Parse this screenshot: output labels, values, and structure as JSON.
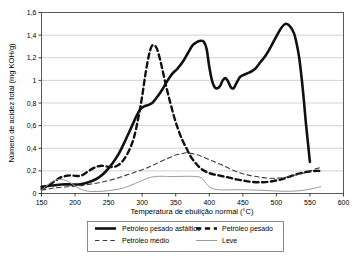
{
  "chart_data": {
    "type": "line",
    "title": "",
    "xlabel": "Temperatura de ebulição normal (°C)",
    "ylabel": "Número de acidez total (mg KOH/g)",
    "xlim": [
      150,
      600
    ],
    "ylim": [
      0,
      1.6
    ],
    "xticks": [
      150,
      200,
      250,
      300,
      350,
      400,
      450,
      500,
      550,
      600
    ],
    "yticks": [
      0,
      0.2,
      0.4,
      0.6,
      0.8,
      1,
      1.2,
      1.4,
      1.6
    ],
    "xtick_labels": [
      "150",
      "200",
      "250",
      "300",
      "350",
      "400",
      "450",
      "500",
      "550",
      "600"
    ],
    "ytick_labels": [
      "0",
      "0,2",
      "0,4",
      "0,6",
      "0,8",
      "1",
      "1,2",
      "1,4",
      "1,6"
    ],
    "grid": "horizontal",
    "legend_position": "bottom",
    "decimal_separator": ",",
    "series": [
      {
        "name": "Petróleo pesado asfáltico",
        "style": "solid-thick",
        "color": "#111111",
        "width": 2.6,
        "x": [
          150,
          165,
          180,
          195,
          205,
          215,
          225,
          235,
          245,
          255,
          265,
          275,
          285,
          292,
          298,
          303,
          308,
          315,
          322,
          330,
          338,
          345,
          352,
          360,
          368,
          375,
          382,
          388,
          392,
          396,
          400,
          404,
          408,
          412,
          416,
          420,
          424,
          428,
          432,
          436,
          440,
          446,
          452,
          460,
          468,
          476,
          484,
          492,
          500,
          508,
          514,
          520,
          526,
          530,
          534,
          538,
          541,
          544,
          547,
          549,
          550
        ],
        "y": [
          0.06,
          0.07,
          0.08,
          0.08,
          0.08,
          0.09,
          0.11,
          0.14,
          0.19,
          0.26,
          0.35,
          0.47,
          0.6,
          0.69,
          0.75,
          0.77,
          0.78,
          0.8,
          0.85,
          0.92,
          1.0,
          1.06,
          1.1,
          1.16,
          1.24,
          1.31,
          1.34,
          1.35,
          1.34,
          1.28,
          1.12,
          1.0,
          0.94,
          0.93,
          0.95,
          1.0,
          1.02,
          0.99,
          0.94,
          0.93,
          0.97,
          1.03,
          1.05,
          1.07,
          1.1,
          1.16,
          1.22,
          1.3,
          1.39,
          1.47,
          1.5,
          1.48,
          1.42,
          1.33,
          1.2,
          1.0,
          0.82,
          0.62,
          0.45,
          0.33,
          0.28
        ]
      },
      {
        "name": "Petróleo pesado",
        "style": "dashed-thick",
        "color": "#111111",
        "width": 2.4,
        "x": [
          150,
          160,
          170,
          178,
          186,
          194,
          202,
          210,
          218,
          226,
          234,
          240,
          246,
          252,
          258,
          264,
          270,
          276,
          282,
          288,
          294,
          300,
          305,
          310,
          314,
          318,
          322,
          326,
          330,
          336,
          342,
          348,
          354,
          360,
          366,
          372,
          378,
          384,
          390,
          398,
          406,
          414,
          422,
          430,
          440,
          450,
          460,
          470,
          480,
          490,
          500,
          510,
          520,
          530,
          540,
          550,
          560,
          566
        ],
        "y": [
          0.04,
          0.07,
          0.11,
          0.14,
          0.155,
          0.16,
          0.155,
          0.16,
          0.19,
          0.22,
          0.24,
          0.245,
          0.24,
          0.235,
          0.235,
          0.25,
          0.28,
          0.33,
          0.4,
          0.5,
          0.66,
          0.86,
          1.06,
          1.22,
          1.3,
          1.31,
          1.28,
          1.2,
          1.1,
          0.94,
          0.8,
          0.67,
          0.56,
          0.47,
          0.4,
          0.33,
          0.28,
          0.24,
          0.21,
          0.185,
          0.17,
          0.16,
          0.15,
          0.14,
          0.125,
          0.115,
          0.105,
          0.1,
          0.1,
          0.105,
          0.115,
          0.13,
          0.15,
          0.17,
          0.185,
          0.195,
          0.2,
          0.2
        ]
      },
      {
        "name": "Petróleo médio",
        "style": "dashed-thin",
        "color": "#3a3a3a",
        "width": 1.1,
        "x": [
          150,
          160,
          170,
          180,
          190,
          200,
          210,
          220,
          230,
          240,
          250,
          260,
          270,
          280,
          290,
          300,
          310,
          320,
          330,
          340,
          350,
          358,
          365,
          372,
          380,
          388,
          396,
          404,
          412,
          420,
          430,
          440,
          450,
          460,
          470,
          480,
          490,
          500,
          510,
          520,
          530,
          540,
          550,
          560,
          566
        ],
        "y": [
          0.03,
          0.04,
          0.05,
          0.055,
          0.06,
          0.065,
          0.07,
          0.08,
          0.09,
          0.1,
          0.115,
          0.13,
          0.15,
          0.17,
          0.19,
          0.21,
          0.235,
          0.26,
          0.29,
          0.315,
          0.34,
          0.35,
          0.36,
          0.355,
          0.345,
          0.33,
          0.31,
          0.29,
          0.27,
          0.25,
          0.22,
          0.195,
          0.175,
          0.16,
          0.15,
          0.14,
          0.135,
          0.135,
          0.14,
          0.15,
          0.165,
          0.18,
          0.2,
          0.22,
          0.23
        ]
      },
      {
        "name": "Leve",
        "style": "solid-thin",
        "color": "#9a9a9a",
        "width": 1.0,
        "x": [
          150,
          158,
          166,
          172,
          178,
          184,
          190,
          196,
          202,
          210,
          218,
          226,
          234,
          242,
          250,
          258,
          266,
          274,
          282,
          290,
          298,
          306,
          314,
          320,
          326,
          330,
          334,
          336,
          338,
          342,
          348,
          356,
          364,
          372,
          380,
          386,
          390,
          394,
          398,
          404,
          412,
          420,
          430,
          440,
          450,
          460,
          470,
          480,
          490,
          500,
          510,
          520,
          530,
          540,
          550,
          560,
          566
        ],
        "y": [
          0.03,
          0.07,
          0.105,
          0.12,
          0.125,
          0.12,
          0.105,
          0.085,
          0.06,
          0.035,
          0.022,
          0.018,
          0.018,
          0.02,
          0.025,
          0.032,
          0.04,
          0.052,
          0.07,
          0.09,
          0.11,
          0.13,
          0.145,
          0.15,
          0.152,
          0.152,
          0.152,
          0.15,
          0.15,
          0.15,
          0.15,
          0.151,
          0.152,
          0.152,
          0.15,
          0.145,
          0.13,
          0.1,
          0.07,
          0.045,
          0.035,
          0.032,
          0.032,
          0.033,
          0.033,
          0.032,
          0.03,
          0.028,
          0.025,
          0.022,
          0.02,
          0.02,
          0.022,
          0.028,
          0.038,
          0.052,
          0.06
        ]
      }
    ]
  },
  "legend": {
    "entries": [
      {
        "label": "Petróleo pesado asfáltico",
        "swatch": "solid-thick"
      },
      {
        "label": "Petróleo pesado",
        "swatch": "dashed-thick"
      },
      {
        "label": "Petróleo médio",
        "swatch": "dashed-thin"
      },
      {
        "label": "Leve",
        "swatch": "solid-thin"
      }
    ]
  }
}
